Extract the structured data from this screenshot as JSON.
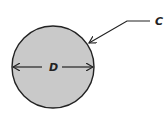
{
  "diagram": {
    "type": "circle-geometry",
    "shape": "circle",
    "fill_color": "#c9c9c9",
    "stroke_color": "#222222",
    "labels": {
      "diameter": "D",
      "circumference": "C"
    },
    "annotations": [
      {
        "label": "D",
        "meaning": "diameter",
        "style": "double-headed arrow across circle"
      },
      {
        "label": "C",
        "meaning": "circumference",
        "style": "leader arrow pointing to circle edge"
      }
    ]
  }
}
